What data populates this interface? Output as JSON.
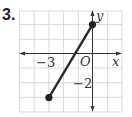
{
  "problem_number": "3.",
  "axes": {
    "x_label": "x",
    "y_label": "y",
    "origin_label": "O",
    "tick_labels": [
      {
        "axis": "x",
        "value": -3,
        "text": "−3"
      },
      {
        "axis": "y",
        "value": -2,
        "text": "−2"
      }
    ]
  },
  "grid": {
    "x_min": -5,
    "x_max": 2,
    "y_min": -4,
    "y_max": 3,
    "unit_px": 14.7
  },
  "segment": {
    "start": {
      "x": -3,
      "y": -3
    },
    "end": {
      "x": 0,
      "y": 2
    }
  },
  "colors": {
    "grid": "#cfcfcf",
    "axis": "#333333",
    "segment": "#2a2a2a",
    "point": "#222222"
  }
}
